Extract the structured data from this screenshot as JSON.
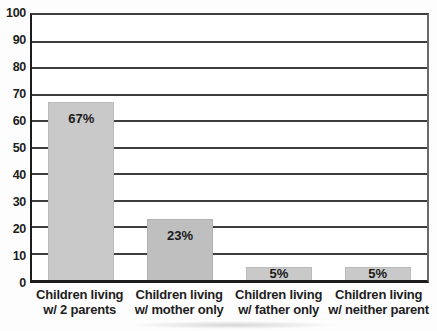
{
  "chart_data": {
    "type": "bar",
    "title": "",
    "xlabel": "",
    "ylabel": "",
    "ylim": [
      0,
      100
    ],
    "ytick_interval": 10,
    "yticks": [
      "100",
      "90",
      "80",
      "70",
      "60",
      "50",
      "40",
      "30",
      "20",
      "10",
      "0"
    ],
    "grid": "horizontal",
    "legend": "none",
    "categories": [
      {
        "line1": "Children living",
        "line2": "w/ 2 parents"
      },
      {
        "line1": "Children living",
        "line2": "w/ mother only"
      },
      {
        "line1": "Children living",
        "line2": "w/ father only"
      },
      {
        "line1": "Children living",
        "line2": "w/ neither parent"
      }
    ],
    "values": [
      67,
      23,
      5,
      5
    ],
    "bars": [
      {
        "label": "67%",
        "value": 67,
        "color": "#c9c9c9"
      },
      {
        "label": "23%",
        "value": 23,
        "color": "#bfbfbf"
      },
      {
        "label": "5%",
        "value": 5,
        "color": "#c9c9c9"
      },
      {
        "label": "5%",
        "value": 5,
        "color": "#c9c9c9"
      }
    ]
  },
  "colors": {
    "bar_fill": "#c9c9c9",
    "bar_fill_alt": "#bfbfbf",
    "gridline": "#3d3d3d",
    "axis": "#1c1c1c",
    "text": "#1e1e1e",
    "background": "#fdfdfd"
  }
}
